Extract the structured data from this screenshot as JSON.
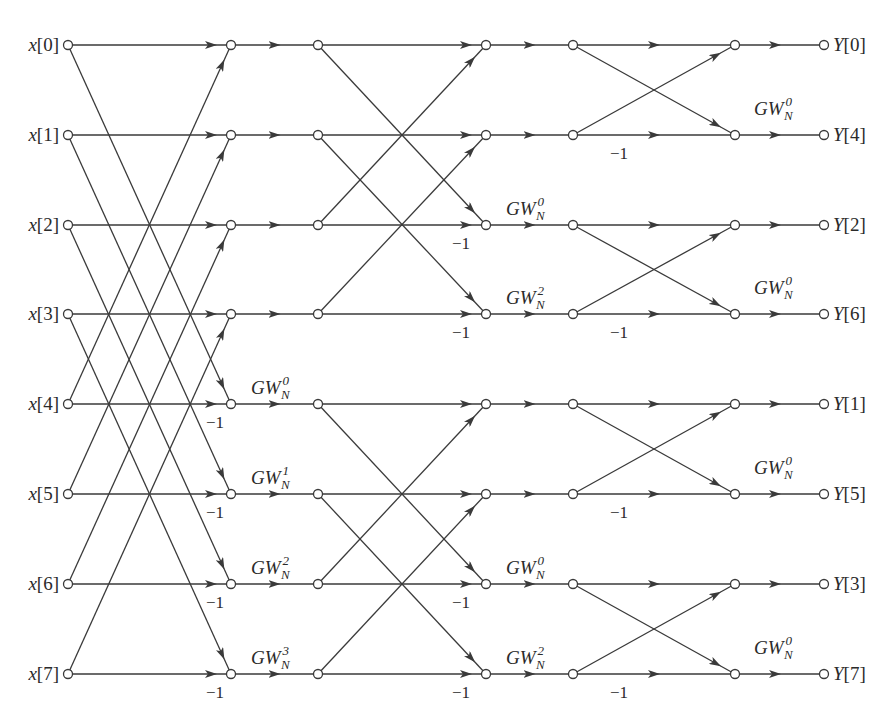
{
  "diagram": {
    "type": "8-point decimation-in-frequency FFT signal flow graph",
    "columns_x": [
      68,
      231,
      318,
      486,
      573,
      735,
      824
    ],
    "rows_y": [
      45,
      135,
      225,
      314,
      404,
      494,
      584,
      674
    ],
    "inputs": [
      "x[0]",
      "x[1]",
      "x[2]",
      "x[3]",
      "x[4]",
      "x[5]",
      "x[6]",
      "x[7]"
    ],
    "outputs": [
      "Y[0]",
      "Y[4]",
      "Y[2]",
      "Y[6]",
      "Y[1]",
      "Y[5]",
      "Y[3]",
      "Y[7]"
    ],
    "stage1_twiddles": [
      {
        "row": 4,
        "text": "GW",
        "sub": "N",
        "sup": "0"
      },
      {
        "row": 5,
        "text": "GW",
        "sub": "N",
        "sup": "1"
      },
      {
        "row": 6,
        "text": "GW",
        "sub": "N",
        "sup": "2"
      },
      {
        "row": 7,
        "text": "GW",
        "sub": "N",
        "sup": "3"
      }
    ],
    "stage2_twiddles": [
      {
        "row": 2,
        "text": "GW",
        "sub": "N",
        "sup": "0"
      },
      {
        "row": 3,
        "text": "GW",
        "sub": "N",
        "sup": "2"
      },
      {
        "row": 6,
        "text": "GW",
        "sub": "N",
        "sup": "0"
      },
      {
        "row": 7,
        "text": "GW",
        "sub": "N",
        "sup": "2"
      }
    ],
    "stage3_twiddles": [
      {
        "row": 1,
        "text": "GW",
        "sub": "N",
        "sup": "0"
      },
      {
        "row": 3,
        "text": "GW",
        "sub": "N",
        "sup": "0"
      },
      {
        "row": 5,
        "text": "GW",
        "sub": "N",
        "sup": "0"
      },
      {
        "row": 7,
        "text": "GW",
        "sub": "N",
        "sup": "0"
      }
    ],
    "minus_one_label": "−1",
    "stage1_minus_rows": [
      4,
      5,
      6,
      7
    ],
    "stage2_minus_rows": [
      2,
      3,
      6,
      7
    ],
    "stage3_minus_rows": [
      1,
      3,
      5,
      7
    ],
    "colors": {
      "line": "#3a3a3a",
      "text": "#2a2a2a",
      "background": "#ffffff"
    }
  }
}
